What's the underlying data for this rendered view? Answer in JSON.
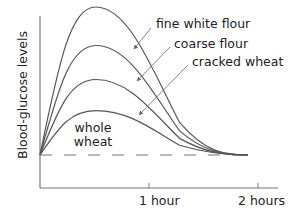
{
  "chart_data": {
    "type": "line",
    "title": "",
    "xlabel": "",
    "ylabel": "Blood-glucose levels",
    "x_ticks": [
      "1 hour",
      "2 hours"
    ],
    "x_tick_values_hours": [
      1,
      2
    ],
    "xlim_hours": [
      0,
      2.2
    ],
    "y_units": "relative (baseline = 0, highest peak = 100)",
    "ylim": [
      -20,
      105
    ],
    "baseline": {
      "style": "dashed",
      "value": 0,
      "description": "fasting blood-glucose level"
    },
    "grid": false,
    "legend": "direct labels with arrows",
    "series": [
      {
        "name": "fine white flour",
        "peak_time_hours": 0.5,
        "peak_value": 100,
        "return_time_hours": 1.9,
        "x": [
          0,
          0.25,
          0.5,
          0.75,
          1.0,
          1.25,
          1.5,
          1.75,
          1.9
        ],
        "values": [
          0,
          72,
          100,
          86,
          55,
          28,
          11,
          3,
          0
        ]
      },
      {
        "name": "coarse flour",
        "peak_time_hours": 0.5,
        "peak_value": 74,
        "return_time_hours": 1.9,
        "x": [
          0,
          0.25,
          0.5,
          0.75,
          1.0,
          1.25,
          1.5,
          1.75,
          1.9
        ],
        "values": [
          0,
          54,
          74,
          63,
          40,
          20,
          8,
          2,
          0
        ]
      },
      {
        "name": "cracked wheat",
        "peak_time_hours": 0.5,
        "peak_value": 51,
        "return_time_hours": 1.9,
        "x": [
          0,
          0.25,
          0.5,
          0.75,
          1.0,
          1.25,
          1.5,
          1.75,
          1.9
        ],
        "values": [
          0,
          37,
          51,
          43,
          27,
          13,
          5,
          1,
          0
        ]
      },
      {
        "name": "whole wheat",
        "peak_time_hours": 0.5,
        "peak_value": 30,
        "return_time_hours": 1.9,
        "x": [
          0,
          0.25,
          0.5,
          0.75,
          1.0,
          1.25,
          1.5,
          1.75,
          1.9
        ],
        "values": [
          0,
          21,
          30,
          25,
          16,
          8,
          3,
          1,
          0
        ]
      }
    ],
    "annotations": [
      "fine white flour",
      "coarse flour",
      "cracked wheat",
      "whole wheat"
    ]
  },
  "labels": {
    "ylabel": "Blood-glucose levels",
    "fine_white_flour": "fine white flour",
    "coarse_flour": "coarse flour",
    "cracked_wheat": "cracked wheat",
    "whole_wheat_line1": "whole",
    "whole_wheat_line2": "wheat",
    "tick_1": "1 hour",
    "tick_2": "2 hours"
  },
  "colors": {
    "curve": "#555555",
    "axis": "#777777",
    "text": "#222222"
  }
}
